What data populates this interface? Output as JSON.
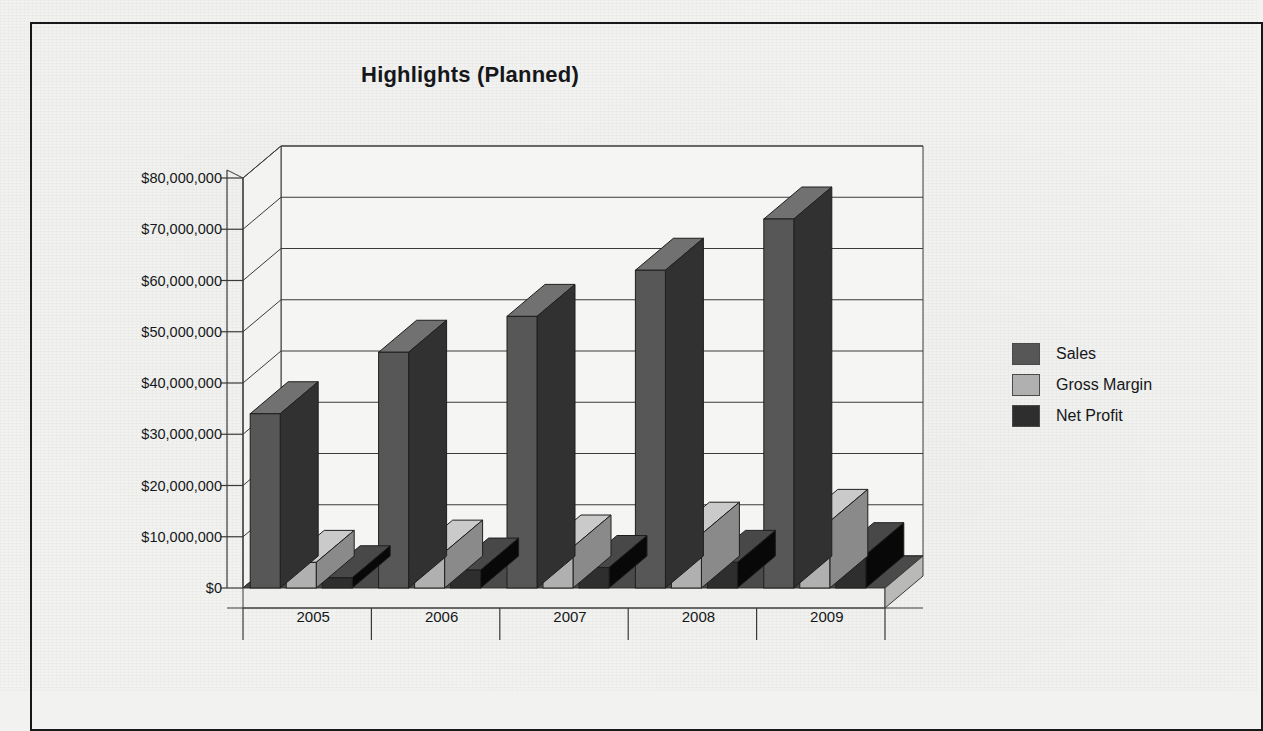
{
  "chart_data": {
    "type": "bar",
    "title": "Highlights (Planned)",
    "xlabel": "",
    "ylabel": "",
    "ylim": [
      0,
      80000000
    ],
    "ytick_labels": [
      "$80,000,000",
      "$70,000,000",
      "$60,000,000",
      "$50,000,000",
      "$40,000,000",
      "$30,000,000",
      "$20,000,000",
      "$10,000,000",
      "$0"
    ],
    "ytick_values": [
      80000000,
      70000000,
      60000000,
      50000000,
      40000000,
      30000000,
      20000000,
      10000000,
      0
    ],
    "categories": [
      "2005",
      "2006",
      "2007",
      "2008",
      "2009"
    ],
    "grid": true,
    "legend_position": "right",
    "style": "3d-column",
    "series": [
      {
        "name": "Sales",
        "color": "#575757",
        "values": [
          34000000,
          46000000,
          53000000,
          62000000,
          72000000
        ]
      },
      {
        "name": "Gross Margin",
        "color": "#b0b0b0",
        "values": [
          5000000,
          7000000,
          8000000,
          10500000,
          13000000
        ]
      },
      {
        "name": "Net Profit",
        "color": "#2e2e2e",
        "values": [
          2000000,
          3500000,
          4000000,
          5000000,
          6500000
        ]
      }
    ]
  },
  "figure": {
    "frame_color": "#16181a",
    "background": "#f3f3f1",
    "axis_color": "#3a3a3a",
    "floor_color": "#8d8d8d",
    "floor_top_color": "#4a4a4a"
  }
}
